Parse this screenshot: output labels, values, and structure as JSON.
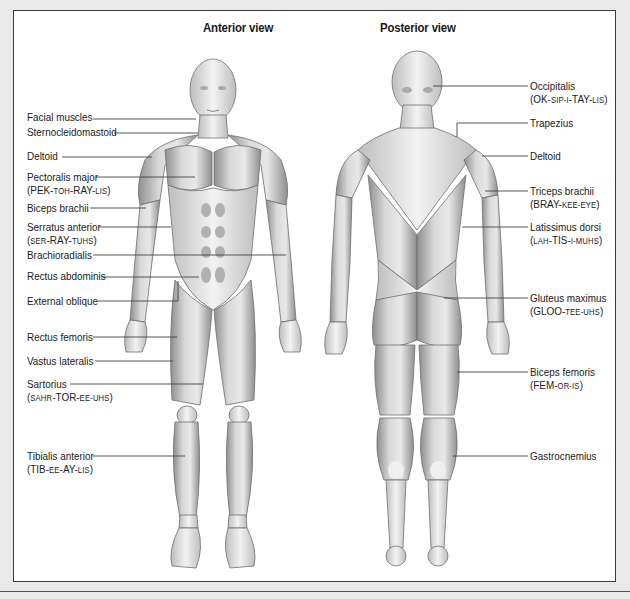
{
  "diagram": {
    "anterior_title": "Anterior view",
    "posterior_title": "Posterior view"
  },
  "anterior_labels": [
    {
      "name": "Facial muscles",
      "pron": null,
      "x": 27,
      "y": 111,
      "line": [
        [
          93,
          119
        ],
        [
          196,
          119
        ]
      ]
    },
    {
      "name": "Sternocleidomastoid",
      "pron": null,
      "x": 27,
      "y": 126,
      "line": [
        [
          114,
          133
        ],
        [
          198,
          133
        ]
      ]
    },
    {
      "name": "Deltoid",
      "pron": null,
      "x": 27,
      "y": 150,
      "line": [
        [
          62,
          157
        ],
        [
          152,
          157
        ]
      ]
    },
    {
      "name": "Pectoralis major",
      "pron": [
        [
          "PEK-",
          "n"
        ],
        [
          "toh",
          "s"
        ],
        [
          "-RAY-",
          "n"
        ],
        [
          "lis",
          "s"
        ]
      ],
      "x": 27,
      "y": 171,
      "line": [
        [
          96,
          177
        ],
        [
          195,
          177
        ]
      ]
    },
    {
      "name": "Biceps brachii",
      "pron": null,
      "x": 27,
      "y": 202,
      "line": [
        [
          90,
          208
        ],
        [
          146,
          208
        ]
      ]
    },
    {
      "name": "Serratus anterior",
      "pron": [
        [
          "ser",
          "s"
        ],
        [
          "-RAY-",
          "n"
        ],
        [
          "tuhs",
          "s"
        ]
      ],
      "x": 27,
      "y": 221,
      "line": [
        [
          99,
          227
        ],
        [
          171,
          227
        ]
      ]
    },
    {
      "name": "Brachioradialis",
      "pron": null,
      "x": 27,
      "y": 249,
      "line": [
        [
          93,
          255
        ],
        [
          286,
          255
        ]
      ]
    },
    {
      "name": "Rectus abdominis",
      "pron": null,
      "x": 27,
      "y": 270,
      "line": [
        [
          101,
          277
        ],
        [
          199,
          277
        ]
      ]
    },
    {
      "name": "External oblique",
      "pron": null,
      "x": 27,
      "y": 295,
      "line": [
        [
          98,
          301
        ],
        [
          178,
          301
        ],
        [
          178,
          281
        ]
      ]
    },
    {
      "name": "Rectus femoris",
      "pron": null,
      "x": 27,
      "y": 331,
      "line": [
        [
          93,
          337
        ],
        [
          177,
          337
        ]
      ]
    },
    {
      "name": "Vastus lateralis",
      "pron": null,
      "x": 27,
      "y": 355,
      "line": [
        [
          95,
          361
        ],
        [
          173,
          361
        ]
      ]
    },
    {
      "name": "Sartorius",
      "pron": [
        [
          "sahr",
          "s"
        ],
        [
          "-TOR-",
          "n"
        ],
        [
          "ee-uhs",
          "s"
        ]
      ],
      "x": 27,
      "y": 378,
      "line": [
        [
          70,
          384
        ],
        [
          203,
          384
        ]
      ]
    },
    {
      "name": "Tibialis anterior",
      "pron": [
        [
          "TIB-",
          "n"
        ],
        [
          "ee",
          "s"
        ],
        [
          "-AY-",
          "n"
        ],
        [
          "lis",
          "s"
        ]
      ],
      "x": 27,
      "y": 450,
      "line": [
        [
          93,
          456
        ],
        [
          185,
          456
        ]
      ]
    }
  ],
  "posterior_labels": [
    {
      "name": "Occipitalis",
      "pron": [
        [
          "OK-",
          "n"
        ],
        [
          "sip-i",
          "s"
        ],
        [
          "-TAY-",
          "n"
        ],
        [
          "lis",
          "s"
        ]
      ],
      "x": 530,
      "y": 80,
      "line": [
        [
          433,
          86
        ],
        [
          528,
          86
        ]
      ]
    },
    {
      "name": "Trapezius",
      "pron": null,
      "x": 530,
      "y": 117,
      "line": [
        [
          457,
          137
        ],
        [
          457,
          123
        ],
        [
          528,
          123
        ]
      ]
    },
    {
      "name": "Deltoid",
      "pron": null,
      "x": 530,
      "y": 150,
      "line": [
        [
          482,
          156
        ],
        [
          528,
          156
        ]
      ]
    },
    {
      "name": "Triceps brachii",
      "pron": [
        [
          "BRAY-",
          "n"
        ],
        [
          "kee-eye",
          "s"
        ]
      ],
      "x": 530,
      "y": 185,
      "line": [
        [
          485,
          191
        ],
        [
          528,
          191
        ]
      ]
    },
    {
      "name": "Latissimus dorsi",
      "pron": [
        [
          "lah",
          "s"
        ],
        [
          "-TIS-",
          "n"
        ],
        [
          "i-muhs",
          "s"
        ]
      ],
      "x": 530,
      "y": 221,
      "line": [
        [
          462,
          227
        ],
        [
          528,
          227
        ]
      ]
    },
    {
      "name": "Gluteus maximus",
      "pron": [
        [
          "GLOO-",
          "n"
        ],
        [
          "tee-uhs",
          "s"
        ]
      ],
      "x": 530,
      "y": 292,
      "line": [
        [
          444,
          298
        ],
        [
          528,
          298
        ]
      ]
    },
    {
      "name": "Biceps femoris",
      "pron": [
        [
          "FEM-",
          "n"
        ],
        [
          "or-is",
          "s"
        ]
      ],
      "x": 530,
      "y": 366,
      "line": [
        [
          457,
          372
        ],
        [
          528,
          372
        ]
      ]
    },
    {
      "name": "Gastrocnemius",
      "pron": null,
      "x": 530,
      "y": 450,
      "line": [
        [
          453,
          456
        ],
        [
          528,
          456
        ]
      ]
    }
  ],
  "colors": {
    "page_background": "#e9e9e9",
    "frame_background": "#ffffff",
    "frame_border": "#3a3a3a",
    "leader_line": "#444444",
    "muscle_fill": "#cfcfcf",
    "muscle_shade": "#9a9a9a"
  }
}
